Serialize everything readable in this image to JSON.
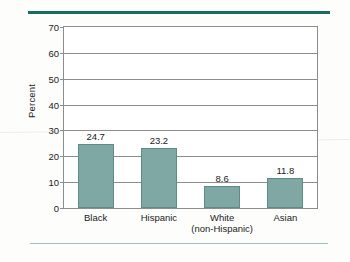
{
  "chart_data": {
    "type": "bar",
    "title": "",
    "subtitle": "",
    "xlabel": "",
    "ylabel": "Percent",
    "ylim": [
      0,
      70
    ],
    "ytick_step": 10,
    "yticks": [
      "70",
      "60",
      "50",
      "40",
      "30",
      "20",
      "10",
      "0"
    ],
    "grid": true,
    "legend": "none",
    "categories": [
      "Black",
      "Hispanic",
      "White (non-Hispanic)",
      "Asian"
    ],
    "category_lines": [
      [
        "Black"
      ],
      [
        "Hispanic"
      ],
      [
        "White",
        "(non-Hispanic)"
      ],
      [
        "Asian"
      ]
    ],
    "values": [
      24.7,
      23.2,
      8.6,
      11.8
    ],
    "value_labels": [
      "24.7",
      "23.2",
      "8.6",
      "11.8"
    ],
    "bar_color": "#7fa8a4",
    "bar_edge_color": "#5f8a86",
    "axis_color": "#8d8d8d",
    "rule_top_color": "#1a6b63",
    "rule_bottom_color": "#9dc0bc"
  }
}
